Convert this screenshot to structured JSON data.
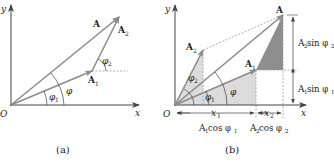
{
  "colors": {
    "vector": "#8c8c8c",
    "axis": "#444444",
    "dashed": "#9a9a9a",
    "shade_light": "#d9d9d9",
    "shade_dark": "#8e8e8e",
    "text": "#222222"
  },
  "diagram_a": {
    "caption": "(a)",
    "origin": "O",
    "x_axis": "x",
    "y_axis": "y",
    "vector_A": "A",
    "vector_A1": "A",
    "vector_A1_sub": "1",
    "vector_A2": "A",
    "vector_A2_sub": "2",
    "angle_phi": "φ",
    "angle_phi1": "φ",
    "angle_phi1_sub": "1",
    "angle_phi2": "φ",
    "angle_phi2_sub": "2"
  },
  "diagram_b": {
    "caption": "(b)",
    "origin": "O",
    "x_axis": "x",
    "y_axis": "y",
    "vector_A": "A",
    "vector_A1": "A",
    "vector_A1_sub": "1",
    "vector_A2": "A",
    "vector_A2_sub": "2",
    "angle_phi": "φ",
    "angle_phi1": "φ",
    "angle_phi1_sub": "1",
    "angle_phi2": "φ",
    "angle_phi2_sub": "2",
    "x1": "x",
    "x1_sub": "1",
    "x2": "x",
    "x2_sub": "2",
    "A1cos_pre": "A",
    "A1cos_sub": "1",
    "A1cos_fn": "cos φ",
    "A1cos_fn_sub": "1",
    "A2cos_pre": "A",
    "A2cos_sub": "2",
    "A2cos_fn": "cos φ",
    "A2cos_fn_sub": "2",
    "A2sin_pre": "A",
    "A2sin_sub": "2",
    "A2sin_fn": "sin φ",
    "A2sin_fn_sub": "2",
    "A1sin_pre": "A",
    "A1sin_sub": "1",
    "A1sin_fn": "sin φ",
    "A1sin_fn_sub": "1"
  }
}
